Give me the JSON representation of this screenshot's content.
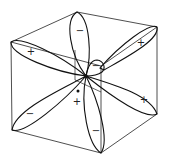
{
  "diagram": {
    "colors": {
      "line": "#111111",
      "background": "#ffffff"
    },
    "lobes": [
      {
        "id": "top",
        "sign": "−"
      },
      {
        "id": "upper-left",
        "sign": "+"
      },
      {
        "id": "upper-right",
        "sign": "+"
      },
      {
        "id": "small-back",
        "sign": "−"
      },
      {
        "id": "lower-right",
        "sign": "+"
      },
      {
        "id": "lower-left",
        "sign": "−"
      },
      {
        "id": "bottom",
        "sign": "−"
      },
      {
        "id": "center-small",
        "sign": "+"
      }
    ]
  }
}
